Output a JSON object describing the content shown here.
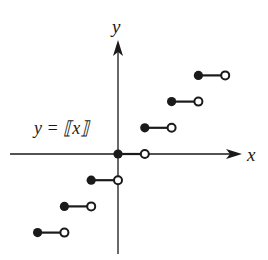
{
  "chart_data": {
    "type": "line",
    "title": "",
    "function_label": "y = ⟦x⟧",
    "xlabel": "x",
    "ylabel": "y",
    "grid": false,
    "xlim": [
      -3.5,
      4.5
    ],
    "ylim": [
      -4,
      4.5
    ],
    "steps": [
      {
        "x_start": -3,
        "x_end": -2,
        "y": -3,
        "closed_left": true,
        "open_right": true
      },
      {
        "x_start": -2,
        "x_end": -1,
        "y": -2,
        "closed_left": true,
        "open_right": true
      },
      {
        "x_start": -1,
        "x_end": 0,
        "y": -1,
        "closed_left": true,
        "open_right": true
      },
      {
        "x_start": 0,
        "x_end": 1,
        "y": 0,
        "closed_left": true,
        "open_right": true
      },
      {
        "x_start": 1,
        "x_end": 2,
        "y": 1,
        "closed_left": true,
        "open_right": true
      },
      {
        "x_start": 2,
        "x_end": 3,
        "y": 2,
        "closed_left": true,
        "open_right": true
      },
      {
        "x_start": 3,
        "x_end": 4,
        "y": 3,
        "closed_left": true,
        "open_right": true
      }
    ]
  },
  "labels": {
    "x_axis": "x",
    "y_axis": "y",
    "function": "y = ⟦x⟧"
  },
  "colors": {
    "ink": "#1a1a1a",
    "background": "#ffffff"
  }
}
